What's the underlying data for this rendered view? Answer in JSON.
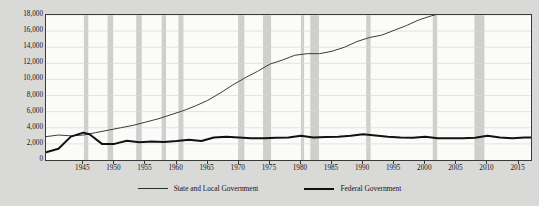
{
  "chart_data": {
    "type": "line",
    "title": "",
    "xlabel": "",
    "ylabel": "Thousands, Thousands of Persons",
    "xlim": [
      1939,
      2017
    ],
    "ylim": [
      0,
      18000
    ],
    "ytick_step": 2000,
    "xtick_step": 5,
    "grid": true,
    "legend_position": "bottom",
    "y_ticks": [
      "0",
      "2,000",
      "4,000",
      "6,000",
      "8,000",
      "10,000",
      "12,000",
      "14,000",
      "16,000",
      "18,000"
    ],
    "y_tick_values": [
      0,
      2000,
      4000,
      6000,
      8000,
      10000,
      12000,
      14000,
      16000,
      18000
    ],
    "x_ticks": [
      "1945",
      "1950",
      "1955",
      "1960",
      "1965",
      "1970",
      "1975",
      "1980",
      "1985",
      "1990",
      "1995",
      "2000",
      "2005",
      "2010",
      "2015"
    ],
    "x_tick_values": [
      1945,
      1950,
      1955,
      1960,
      1965,
      1970,
      1975,
      1980,
      1985,
      1990,
      1995,
      2000,
      2005,
      2010,
      2015
    ],
    "series": [
      {
        "name": "State and Local Government",
        "color": "#3c3c3a",
        "width": 1.0,
        "x": [
          1939,
          1941,
          1943,
          1945,
          1947,
          1949,
          1951,
          1953,
          1955,
          1957,
          1959,
          1961,
          1963,
          1965,
          1967,
          1969,
          1971,
          1973,
          1975,
          1977,
          1979,
          1981,
          1983,
          1985,
          1987,
          1989,
          1991,
          1993,
          1995,
          1997,
          1999,
          2001,
          2003,
          2005,
          2007,
          2009,
          2010,
          2011,
          2013,
          2015,
          2017
        ],
        "values": [
          2900,
          3100,
          3000,
          3100,
          3400,
          3700,
          4000,
          4300,
          4700,
          5100,
          5600,
          6100,
          6700,
          7400,
          8300,
          9300,
          10200,
          11000,
          11900,
          12400,
          13000,
          13200,
          13200,
          13500,
          14000,
          14700,
          15200,
          15500,
          16100,
          16700,
          17400,
          17900,
          18300,
          18700,
          19100,
          19400,
          19300,
          19100,
          19000,
          19200,
          19400
        ]
      },
      {
        "name": "Federal Government",
        "color": "#111111",
        "width": 2.0,
        "x": [
          1939,
          1941,
          1943,
          1945,
          1946,
          1948,
          1950,
          1952,
          1954,
          1956,
          1958,
          1960,
          1962,
          1964,
          1966,
          1968,
          1970,
          1972,
          1974,
          1976,
          1978,
          1980,
          1982,
          1984,
          1986,
          1988,
          1990,
          1992,
          1994,
          1996,
          1998,
          2000,
          2002,
          2004,
          2006,
          2008,
          2010,
          2012,
          2014,
          2016,
          2017
        ],
        "values": [
          950,
          1400,
          2900,
          3400,
          3200,
          2000,
          2000,
          2400,
          2200,
          2300,
          2250,
          2350,
          2500,
          2350,
          2800,
          2900,
          2800,
          2700,
          2700,
          2750,
          2800,
          3000,
          2800,
          2850,
          2900,
          3000,
          3200,
          3050,
          2900,
          2800,
          2750,
          2900,
          2700,
          2700,
          2700,
          2750,
          3000,
          2800,
          2700,
          2800,
          2800
        ]
      }
    ],
    "recession_bands": [
      [
        1945.1,
        1945.8
      ],
      [
        1948.9,
        1949.8
      ],
      [
        1953.5,
        1954.4
      ],
      [
        1957.6,
        1958.3
      ],
      [
        1960.3,
        1961.1
      ],
      [
        1969.9,
        1970.9
      ],
      [
        1973.9,
        1975.2
      ],
      [
        1980.0,
        1980.5
      ],
      [
        1981.5,
        1982.9
      ],
      [
        1990.5,
        1991.2
      ],
      [
        2001.2,
        2001.9
      ],
      [
        2007.9,
        2009.5
      ]
    ],
    "recession_band_color": "#cfcfcd",
    "grid_color": "#d8d8d6",
    "plot_background": "#fbfbfa",
    "page_background": "#d9d9d7"
  },
  "legend": {
    "items": [
      {
        "label": "State and Local Government",
        "style": "thin"
      },
      {
        "label": "Federal Government",
        "style": "thick"
      }
    ]
  }
}
